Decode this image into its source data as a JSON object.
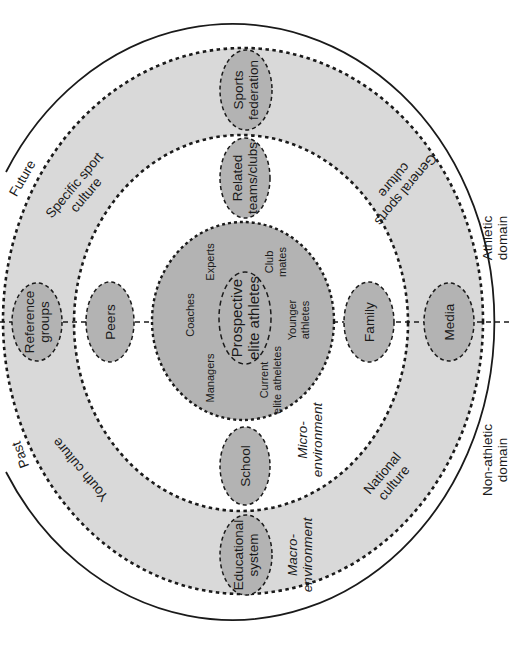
{
  "diagram": {
    "colors": {
      "background": "#ffffff",
      "macro_ring_fill": "#d9d9d9",
      "micro_fill": "#ffffff",
      "core_fill": "#b3b3b3",
      "node_fill": "#b3b3b3",
      "stroke": "#1a1a1a"
    },
    "axes": {
      "time": {
        "past": "Past",
        "future": "Future"
      },
      "domain": {
        "athletic": [
          "Athletic",
          "domain"
        ],
        "non_athletic": [
          "Non-athletic",
          "domain"
        ]
      }
    },
    "levels": {
      "macro": [
        "Macro-",
        "environment"
      ],
      "micro": [
        "Micro-",
        "environment"
      ]
    },
    "macro_cultures": {
      "specific_sport": [
        "Specific sport",
        "culture"
      ],
      "general_sports": [
        "General sports",
        "culture"
      ],
      "youth": [
        "Youth culture"
      ],
      "national": [
        "National",
        "culture"
      ]
    },
    "macro_nodes": {
      "sports_federation": [
        "Sports",
        "federation"
      ],
      "reference_groups": [
        "Reference",
        "groups"
      ],
      "media": [
        "Media"
      ],
      "educational_system": [
        "Educational",
        "system"
      ]
    },
    "micro_nodes": {
      "related_clubs": [
        "Related",
        "teams/clubs"
      ],
      "peers": [
        "Peers"
      ],
      "family": [
        "Family"
      ],
      "school": [
        "School"
      ]
    },
    "core": {
      "center": [
        "Prospective",
        "elite athletes"
      ],
      "members": {
        "coaches": [
          "Coaches"
        ],
        "experts": [
          "Experts"
        ],
        "club_mates": [
          "Club",
          "mates"
        ],
        "managers": [
          "Managers"
        ],
        "current_elite": [
          "Current",
          "elite atheletes"
        ],
        "younger": [
          "Younger",
          "athletes"
        ]
      }
    }
  }
}
